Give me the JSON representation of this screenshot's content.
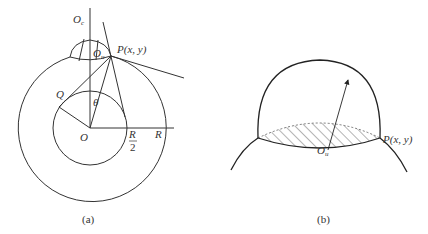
{
  "figure_a": {
    "caption": "(a)",
    "labels": {
      "Oc": "O",
      "Oc_sub": "c",
      "Ou": "O",
      "Ou_sub": "u",
      "P": "P(x, y)",
      "Q": "Q",
      "theta": "θ",
      "O": "O",
      "R_half_num": "R",
      "R_half_den": "2",
      "R": "R"
    }
  },
  "figure_b": {
    "caption": "(b)",
    "labels": {
      "Ou": "O",
      "Ou_sub": "u",
      "P": "P(x, y)"
    }
  }
}
